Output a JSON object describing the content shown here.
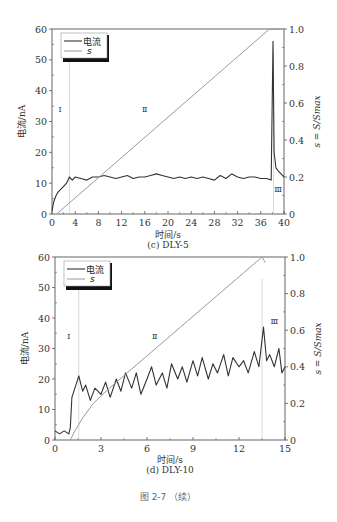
{
  "figure_caption": "图 2-7 （续）",
  "chart_data": [
    {
      "type": "line",
      "subtitle": "(c) DLY-5",
      "xlabel": "时间/s",
      "ylabel_left": "电流/nA",
      "ylabel_right": "s = S/Smax",
      "xlim": [
        0,
        40
      ],
      "ylim_left": [
        0,
        60
      ],
      "ylim_right": [
        0,
        1.0
      ],
      "xticks": [
        "0",
        "4",
        "8",
        "12",
        "16",
        "20",
        "24",
        "28",
        "32",
        "36",
        "40"
      ],
      "yticks_left": [
        "0",
        "10",
        "20",
        "30",
        "40",
        "50",
        "60"
      ],
      "yticks_right": [
        "0",
        "0.2",
        "0.4",
        "0.6",
        "0.8",
        "1.0"
      ],
      "legend": [
        "电流",
        "s"
      ],
      "legend_position": "upper left",
      "grid": false,
      "region_labels": [
        {
          "label": "Ⅰ",
          "x": 1.4,
          "y": 33
        },
        {
          "label": "Ⅱ",
          "x": 16,
          "y": 33
        },
        {
          "label": "Ⅲ",
          "x": 39,
          "y": 7
        }
      ],
      "region_boundaries_x": [
        3,
        38.2
      ],
      "series": [
        {
          "name": "电流",
          "axis": "left",
          "x": [
            0,
            0.3,
            0.7,
            1,
            1.5,
            2,
            2.5,
            3,
            3.5,
            4,
            5,
            6,
            7,
            8,
            9,
            10,
            11,
            12,
            13,
            14,
            15,
            16,
            17,
            18,
            19,
            20,
            21,
            22,
            23,
            24,
            25,
            26,
            27,
            28,
            29,
            30,
            31,
            32,
            33,
            34,
            35,
            36,
            37,
            37.8,
            38.1,
            38.3,
            38.6,
            39,
            39.5,
            40
          ],
          "y": [
            1,
            4,
            6,
            7,
            8,
            9,
            10,
            12,
            11,
            12,
            11.5,
            11,
            12,
            12,
            12.5,
            12,
            11.5,
            12,
            12.5,
            11.5,
            12,
            12,
            12.5,
            13,
            12.5,
            12,
            11.5,
            12,
            11.5,
            12,
            11.5,
            12,
            11.5,
            11,
            12.5,
            11.5,
            13,
            12,
            11.5,
            12,
            12,
            11.5,
            11.5,
            11,
            56,
            20,
            15,
            14,
            13,
            12
          ]
        },
        {
          "name": "s",
          "axis": "right",
          "x": [
            0.8,
            37.5,
            40
          ],
          "y": [
            0,
            1.0,
            1.0
          ]
        }
      ]
    },
    {
      "type": "line",
      "subtitle": "(d) DLY-10",
      "xlabel": "时间/s",
      "ylabel_left": "电流/nA",
      "ylabel_right": "s = S/Smax",
      "xlim": [
        0,
        15
      ],
      "ylim_left": [
        0,
        60
      ],
      "ylim_right": [
        0,
        1.0
      ],
      "xticks": [
        "0",
        "3",
        "6",
        "9",
        "12",
        "15"
      ],
      "yticks_left": [
        "0",
        "10",
        "20",
        "30",
        "40",
        "50",
        "60"
      ],
      "yticks_right": [
        "0",
        "0.2",
        "0.4",
        "0.6",
        "0.8",
        "1.0"
      ],
      "legend": [
        "电流",
        "s"
      ],
      "legend_position": "upper left",
      "grid": false,
      "region_labels": [
        {
          "label": "Ⅰ",
          "x": 0.9,
          "y": 33
        },
        {
          "label": "Ⅱ",
          "x": 6.5,
          "y": 33
        },
        {
          "label": "Ⅲ",
          "x": 14.3,
          "y": 38
        }
      ],
      "region_boundaries_x": [
        1.55,
        13.5
      ],
      "series": [
        {
          "name": "电流",
          "axis": "left",
          "x": [
            0,
            0.3,
            0.6,
            0.9,
            1.0,
            1.1,
            1.3,
            1.55,
            1.8,
            2,
            2.3,
            2.6,
            3,
            3.3,
            3.6,
            4,
            4.3,
            4.6,
            5,
            5.3,
            5.6,
            6,
            6.3,
            6.6,
            7,
            7.3,
            7.6,
            8,
            8.3,
            8.6,
            9,
            9.3,
            9.6,
            10,
            10.3,
            10.6,
            11,
            11.3,
            11.6,
            12,
            12.3,
            12.6,
            13,
            13.3,
            13.6,
            13.8,
            14,
            14.3,
            14.6,
            14.8,
            15
          ],
          "y": [
            3,
            2,
            3,
            2,
            4,
            14,
            17,
            21,
            16,
            18,
            13,
            17,
            15,
            19,
            14,
            20,
            16,
            22,
            17,
            22,
            15,
            20,
            24,
            18,
            22,
            17,
            25,
            20,
            24,
            19,
            26,
            21,
            27,
            20,
            25,
            22,
            28,
            21,
            27,
            24,
            26,
            22,
            29,
            24,
            37,
            26,
            28,
            24,
            30,
            22,
            24
          ]
        },
        {
          "name": "s",
          "axis": "right",
          "x": [
            1.0,
            1.3,
            1.8,
            2.5,
            3.5,
            13.5,
            13.7
          ],
          "y": [
            0,
            0.05,
            0.12,
            0.2,
            0.28,
            1.0,
            0.97
          ]
        }
      ]
    }
  ]
}
